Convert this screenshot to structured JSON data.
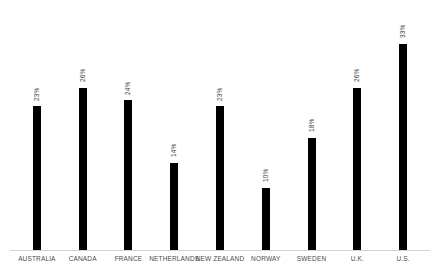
{
  "chart_data": {
    "type": "bar",
    "title": "",
    "subtitle": "",
    "xlabel": "",
    "ylabel": "",
    "grid": false,
    "legend": false,
    "legend_position": "none",
    "axis_line_color": "#d4d4d4",
    "bar_color": "#000000",
    "label_color": "#3a3a3a",
    "ylim": [
      0,
      36
    ],
    "value_suffix": "%",
    "categories": [
      "AUSTRALIA",
      "CANADA",
      "FRANCE",
      "NETHERLANDS",
      "NEW ZEALAND",
      "NORWAY",
      "SWEDEN",
      "U.K.",
      "U.S."
    ],
    "values": [
      23,
      26,
      24,
      14,
      23,
      10,
      18,
      26,
      33
    ],
    "value_labels": [
      "23%",
      "26%",
      "24%",
      "14%",
      "23%",
      "10%",
      "18%",
      "26%",
      "33%"
    ]
  }
}
